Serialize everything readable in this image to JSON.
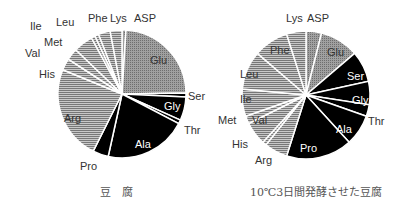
{
  "chart_data": [
    {
      "type": "pie",
      "title": "豆 腐",
      "start": "top, clockwise",
      "categories": [
        "ASP",
        "Glu",
        "Ser",
        "Gly",
        "Thr",
        "Ala",
        "Pro",
        "Arg",
        "His",
        "Val",
        "Met",
        "Ile",
        "Leu",
        "Phe",
        "Lys"
      ],
      "values": [
        1,
        24,
        1,
        6,
        1,
        21,
        4,
        24,
        3,
        3,
        5,
        1,
        1,
        3,
        3
      ],
      "fills": [
        "dot",
        "dot",
        "black",
        "black",
        "black",
        "black",
        "black",
        "hline",
        "hline",
        "hline",
        "hline",
        "hline",
        "hline",
        "hline",
        "hline"
      ]
    },
    {
      "type": "pie",
      "title": "10℃3日間発酵させた豆腐",
      "start": "top, clockwise",
      "categories": [
        "ASP",
        "Glu",
        "Ser",
        "Gly",
        "Thr",
        "Ala",
        "Pro",
        "Arg",
        "His",
        "Val",
        "Met",
        "Ile",
        "Leu",
        "Phe",
        "Lys"
      ],
      "values": [
        4,
        10,
        8,
        6,
        3,
        8,
        17,
        6,
        1,
        6,
        2,
        7,
        10,
        9,
        5
      ],
      "fills": [
        "dot",
        "dot",
        "black",
        "black",
        "black",
        "black",
        "black",
        "hline",
        "hline",
        "hline",
        "hline",
        "hline",
        "hline",
        "hline",
        "hline"
      ]
    }
  ],
  "captions": {
    "left": "豆　腐",
    "right": "10℃3日間発酵させた豆腐"
  }
}
